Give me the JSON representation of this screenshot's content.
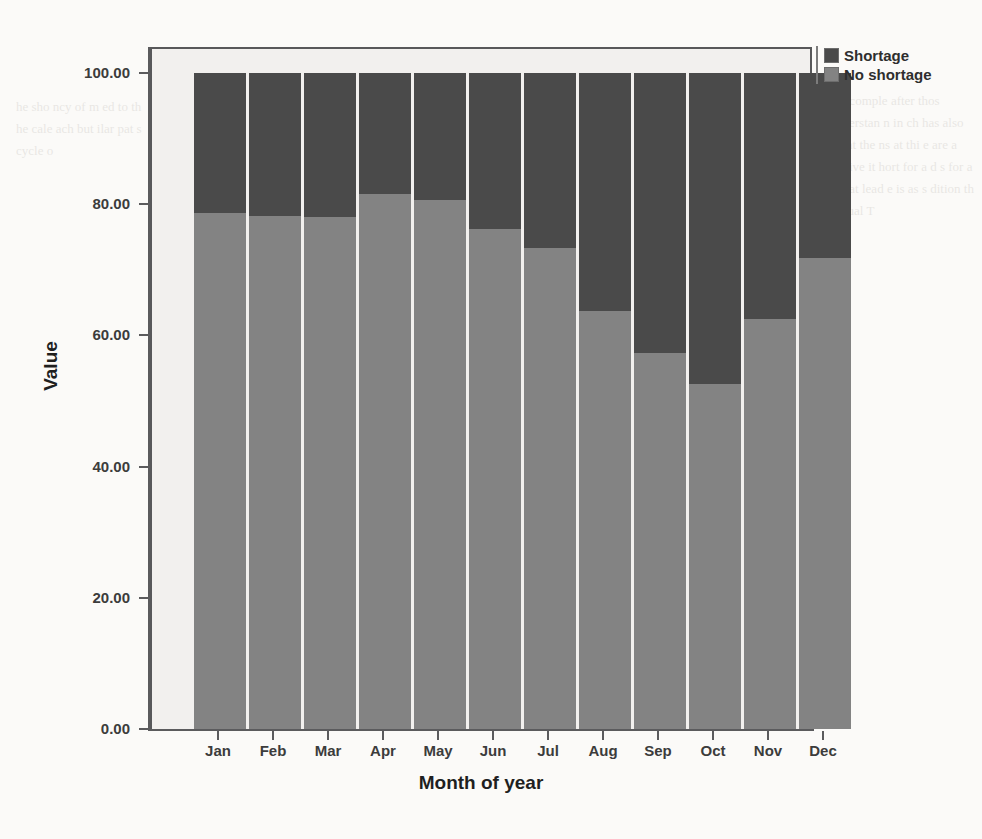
{
  "chart_data": {
    "type": "bar",
    "subtype": "stacked-percentage",
    "title": "",
    "xlabel": "Month of year",
    "ylabel": "Value",
    "categories": [
      "Jan",
      "Feb",
      "Mar",
      "Apr",
      "May",
      "Jun",
      "Jul",
      "Aug",
      "Sep",
      "Oct",
      "Nov",
      "Dec"
    ],
    "series": [
      {
        "name": "No shortage",
        "color": "#838383",
        "values": [
          78.7,
          78.2,
          78.0,
          81.6,
          80.6,
          76.2,
          73.3,
          63.7,
          57.3,
          52.6,
          62.5,
          71.8
        ]
      },
      {
        "name": "Shortage",
        "color": "#4a4a4a",
        "values": [
          21.3,
          21.8,
          22.0,
          18.4,
          19.4,
          23.8,
          26.7,
          36.3,
          42.7,
          47.4,
          37.5,
          28.2
        ]
      }
    ],
    "ylim": [
      0,
      100
    ],
    "yticks": [
      0,
      20,
      40,
      60,
      80,
      100
    ],
    "ytick_labels": [
      "0.00",
      "20.00",
      "40.00",
      "60.00",
      "80.00",
      "100.00"
    ],
    "grid": false,
    "legend_position": "top-right",
    "stack_order": [
      "No shortage",
      "Shortage"
    ]
  },
  "legend": {
    "items": [
      {
        "label": "Shortage",
        "color": "#4a4a4a"
      },
      {
        "label": "No shortage",
        "color": "#838383"
      }
    ]
  },
  "ghost_text": {
    "right": "to comple after thos nderstan n in ch has also rent the ns at thi e are a lative it hort for a d s for a re at lead e is as s dition th usual T",
    "left": "he sho ncy of m ed to th he cale ach but ilar pat s cycle o",
    "bottom": ""
  }
}
